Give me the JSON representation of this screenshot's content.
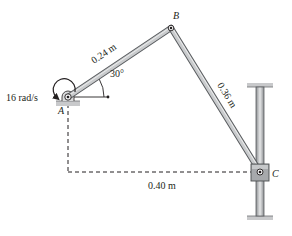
{
  "diagram": {
    "type": "mechanism",
    "points": {
      "A": {
        "label": "A",
        "x": 68,
        "y": 97
      },
      "B": {
        "label": "B",
        "x": 171,
        "y": 28
      },
      "C": {
        "label": "C",
        "x": 260,
        "y": 172
      }
    },
    "labels": {
      "angular_velocity": "16 rad/s",
      "angle": "30°",
      "link_ab": "0.24 m",
      "link_bc": "0.36 m",
      "horizontal_distance": "0.40 m",
      "point_a": "A",
      "point_b": "B",
      "point_c": "C"
    },
    "colors": {
      "link_fill": "#b9bcbf",
      "link_edge": "#5a5d60",
      "ground": "#c8c9cb",
      "text": "#231f20",
      "dashed": "#231f20"
    }
  }
}
